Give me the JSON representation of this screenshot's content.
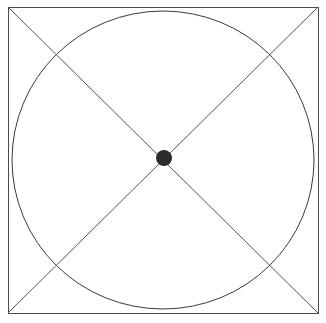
{
  "figure": {
    "canvas": {
      "width": 326,
      "height": 323,
      "background_color": "#ffffff"
    },
    "stroke_color": "#3a3a3a",
    "stroke_width": 1,
    "dot_color": "#2b2b2b",
    "shapes": {
      "square": {
        "name": "bounding-square",
        "x": 8,
        "y": 7,
        "width": 310,
        "height": 306,
        "stroke": "#4a4a4a",
        "fill": "none"
      },
      "circle": {
        "name": "inscribed-circle",
        "cx": 163,
        "cy": 160,
        "rx": 151,
        "ry": 149,
        "stroke": "#3a3a3a",
        "fill": "none"
      },
      "diagonal_tl_br": {
        "name": "diagonal-top-left-to-bottom-right",
        "x1": 8,
        "y1": 7,
        "x2": 318,
        "y2": 313,
        "stroke": "#555555"
      },
      "diagonal_tr_bl": {
        "name": "diagonal-top-right-to-bottom-left",
        "x1": 318,
        "y1": 7,
        "x2": 8,
        "y2": 313,
        "stroke": "#555555"
      },
      "center_dot": {
        "name": "center-point-dot",
        "cx": 164,
        "cy": 158,
        "r": 8,
        "fill": "#2b2b2b"
      }
    }
  },
  "chart_data": {
    "type": "diagram",
    "elements": [
      {
        "id": "square",
        "shape": "rectangle",
        "label": "bounding square",
        "x": 8,
        "y": 7,
        "width": 310,
        "height": 306,
        "filled": false
      },
      {
        "id": "circle",
        "shape": "ellipse",
        "label": "inscribed circle",
        "cx": 163,
        "cy": 160,
        "rx": 151,
        "ry": 149,
        "filled": false
      },
      {
        "id": "diagonal-1",
        "shape": "line",
        "label": "diagonal top-left to bottom-right",
        "from": [
          8,
          7
        ],
        "to": [
          318,
          313
        ]
      },
      {
        "id": "diagonal-2",
        "shape": "line",
        "label": "diagonal top-right to bottom-left",
        "from": [
          318,
          7
        ],
        "to": [
          8,
          313
        ]
      },
      {
        "id": "center-dot",
        "shape": "circle",
        "label": "center point",
        "cx": 164,
        "cy": 158,
        "r": 8,
        "filled": true
      }
    ],
    "intersection_points": [
      {
        "label": "center",
        "x": 164,
        "y": 158,
        "marked": true
      },
      {
        "label": "upper-left circle-diagonal crossing",
        "x": 56,
        "y": 53,
        "marked": false
      },
      {
        "label": "upper-right circle-diagonal crossing",
        "x": 272,
        "y": 52,
        "marked": false
      },
      {
        "label": "lower-left circle-diagonal crossing",
        "x": 56,
        "y": 265,
        "marked": false
      },
      {
        "label": "lower-right circle-diagonal crossing",
        "x": 272,
        "y": 265,
        "marked": false
      }
    ]
  }
}
